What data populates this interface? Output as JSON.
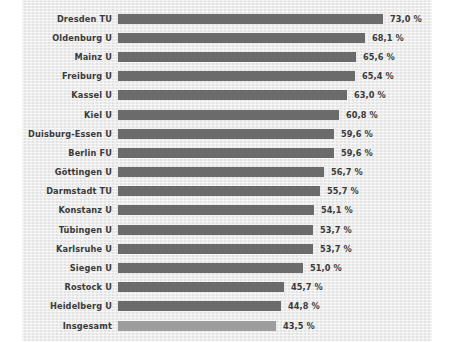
{
  "chart_data": {
    "type": "bar",
    "orientation": "horizontal",
    "title": "",
    "subtitle": "",
    "xlabel": "",
    "ylabel": "",
    "grid": false,
    "legend": null,
    "xlim": [
      0,
      73.0
    ],
    "value_suffix": " %",
    "decimal_separator": ",",
    "categories": [
      "Dresden TU",
      "Oldenburg U",
      "Mainz U",
      "Freiburg U",
      "Kassel U",
      "Kiel U",
      "Duisburg-Essen U",
      "Berlin FU",
      "Göttingen U",
      "Darmstadt TU",
      "Konstanz U",
      "Tübingen U",
      "Karlsruhe U",
      "Siegen U",
      "Rostock U",
      "Heidelberg U",
      "Insgesamt"
    ],
    "values": [
      73.0,
      68.1,
      65.6,
      65.4,
      63.0,
      60.8,
      59.6,
      59.6,
      56.7,
      55.7,
      54.1,
      53.7,
      53.7,
      51.0,
      45.7,
      44.8,
      43.5
    ],
    "value_labels": [
      "73,0 %",
      "68,1 %",
      "65,6 %",
      "65,4 %",
      "63,0 %",
      "60,8 %",
      "59,6 %",
      "59,6 %",
      "56,7 %",
      "55,7 %",
      "54,1 %",
      "53,7 %",
      "53,7 %",
      "51,0 %",
      "45,7 %",
      "44,8 %",
      "43,5 %"
    ],
    "highlight_index": 16,
    "colors": {
      "bar": "#6b6b6b",
      "bar_highlight": "#9d9d9d",
      "panel_background": "#e9e9e9",
      "page_background": "#ffffff",
      "text": "#3a3a3a"
    }
  },
  "rows": [
    {
      "label": "Dresden TU",
      "value": "73,0 %",
      "num": 73.0,
      "total": false
    },
    {
      "label": "Oldenburg U",
      "value": "68,1 %",
      "num": 68.1,
      "total": false
    },
    {
      "label": "Mainz U",
      "value": "65,6 %",
      "num": 65.6,
      "total": false
    },
    {
      "label": "Freiburg U",
      "value": "65,4 %",
      "num": 65.4,
      "total": false
    },
    {
      "label": "Kassel U",
      "value": "63,0 %",
      "num": 63.0,
      "total": false
    },
    {
      "label": "Kiel U",
      "value": "60,8 %",
      "num": 60.8,
      "total": false
    },
    {
      "label": "Duisburg-Essen U",
      "value": "59,6 %",
      "num": 59.6,
      "total": false
    },
    {
      "label": "Berlin FU",
      "value": "59,6 %",
      "num": 59.6,
      "total": false
    },
    {
      "label": "Göttingen U",
      "value": "56,7 %",
      "num": 56.7,
      "total": false
    },
    {
      "label": "Darmstadt TU",
      "value": "55,7 %",
      "num": 55.7,
      "total": false
    },
    {
      "label": "Konstanz U",
      "value": "54,1 %",
      "num": 54.1,
      "total": false
    },
    {
      "label": "Tübingen U",
      "value": "53,7 %",
      "num": 53.7,
      "total": false
    },
    {
      "label": "Karlsruhe U",
      "value": "53,7 %",
      "num": 53.7,
      "total": false
    },
    {
      "label": "Siegen U",
      "value": "51,0 %",
      "num": 51.0,
      "total": false
    },
    {
      "label": "Rostock U",
      "value": "45,7 %",
      "num": 45.7,
      "total": false
    },
    {
      "label": "Heidelberg U",
      "value": "44,8 %",
      "num": 44.8,
      "total": false
    },
    {
      "label": "Insgesamt",
      "value": "43,5 %",
      "num": 43.5,
      "total": true
    }
  ],
  "scale": {
    "bar_origin_x": 118,
    "px_per_unit": 3.63,
    "value_gap_px": 7
  }
}
